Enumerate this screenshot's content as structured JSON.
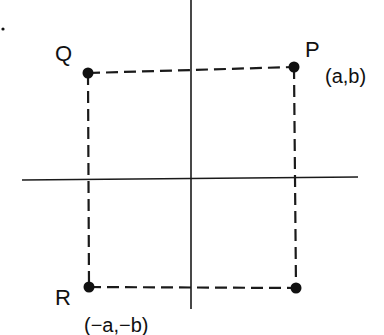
{
  "diagram": {
    "type": "coordinate-plane-rectangle",
    "colors": {
      "ink": "#111111",
      "background": "#ffffff"
    },
    "axes": {
      "horizontal": {
        "x1": 22,
        "y1": 180,
        "x2": 358,
        "y2": 177
      },
      "vertical": {
        "x1": 191,
        "y1": 0,
        "x2": 191,
        "y2": 309
      }
    },
    "points": [
      {
        "id": "Q",
        "label": "Q",
        "coord_label": "",
        "x": 88,
        "y": 73
      },
      {
        "id": "P",
        "label": "P",
        "coord_label": "(a,b)",
        "x": 294,
        "y": 67
      },
      {
        "id": "R",
        "label": "R",
        "coord_label": "(−a,−b)",
        "x": 89,
        "y": 287
      },
      {
        "id": "S",
        "label": "",
        "coord_label": "",
        "x": 296,
        "y": 288
      }
    ],
    "labels": {
      "Q": "Q",
      "P": "P",
      "P_coord": "(a,b)",
      "R": "R",
      "R_coord": "(−a,−b)"
    },
    "stray_mark": {
      "x": 3,
      "y": 29
    }
  }
}
